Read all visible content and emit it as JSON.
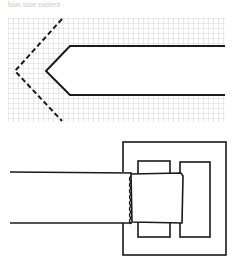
{
  "caption": "bias tape pattern",
  "colors": {
    "line": "#1a1a1a",
    "grid": "#b8b8b8",
    "background": "#ffffff"
  },
  "figure_top": {
    "description": "Strap tip drawn on graph paper with dashed cutting line",
    "grid": {
      "x": 8,
      "y": 18,
      "width": 217,
      "height": 104,
      "cell": 5
    },
    "solid_outline": "M225,46 L70,46 L46,71 L70,95 L225,95",
    "dashed_outline": "M62,19 L15,71 L62,121"
  },
  "figure_bottom": {
    "description": "Strap threaded through a rectangular buckle",
    "buckle_outer": {
      "x": 123,
      "y": 142,
      "w": 103,
      "h": 113
    },
    "bar_left": {
      "x": 138,
      "y": 161,
      "w": 32,
      "h": 76
    },
    "bar_right": {
      "x": 180,
      "y": 162,
      "w": 30,
      "h": 75
    },
    "strap_top_y": 172,
    "strap_bottom_y": 223
  }
}
